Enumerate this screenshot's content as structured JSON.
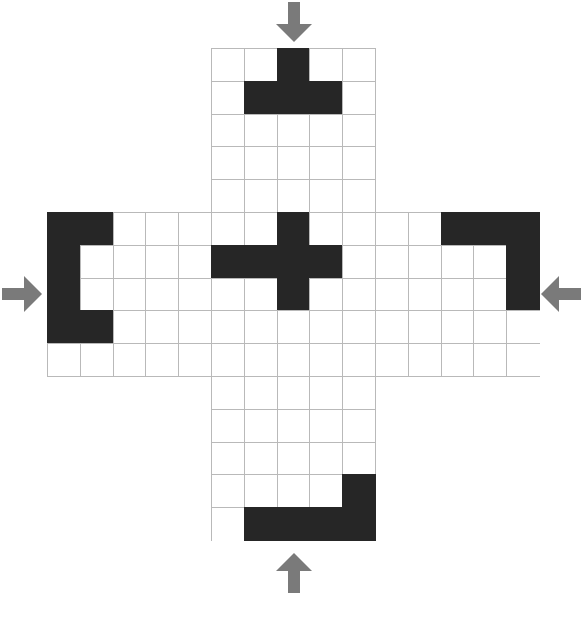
{
  "puzzle": {
    "title": "Plus-shaped grid folding puzzle",
    "grid": {
      "columns": 15,
      "rows": 15,
      "cell_size": 32.8,
      "origin_x": 47,
      "origin_y": 48,
      "line_color": "#b9b9b9",
      "cell_color": "#ffffff",
      "filled_color": "#262626",
      "shape": "plus-cross",
      "arm_span_start": 5,
      "arm_span_end": 9
    },
    "arrows": {
      "color": "#7a7a7a",
      "items": [
        {
          "name": "arrow-top",
          "direction": "down",
          "x": 272,
          "y": 2,
          "w": 44,
          "h": 40
        },
        {
          "name": "arrow-left",
          "direction": "right",
          "x": 2,
          "y": 272,
          "w": 40,
          "h": 44
        },
        {
          "name": "arrow-right",
          "direction": "left",
          "x": 541,
          "y": 272,
          "w": 40,
          "h": 44
        },
        {
          "name": "arrow-bottom",
          "direction": "up",
          "x": 272,
          "y": 553,
          "w": 44,
          "h": 40
        }
      ]
    },
    "filled_cells": {
      "top_arm": [
        [
          7,
          0
        ],
        [
          6,
          1
        ],
        [
          7,
          1
        ],
        [
          8,
          1
        ]
      ],
      "left_arm": [
        [
          0,
          5
        ],
        [
          1,
          5
        ],
        [
          0,
          6
        ],
        [
          0,
          7
        ],
        [
          0,
          8
        ],
        [
          1,
          8
        ]
      ],
      "center": [
        [
          7,
          5
        ],
        [
          5,
          6
        ],
        [
          6,
          6
        ],
        [
          7,
          6
        ],
        [
          8,
          6
        ],
        [
          7,
          7
        ]
      ],
      "right_arm": [
        [
          12,
          5
        ],
        [
          13,
          5
        ],
        [
          14,
          5
        ],
        [
          14,
          6
        ],
        [
          14,
          7
        ]
      ],
      "bottom_arm": [
        [
          9,
          13
        ],
        [
          6,
          14
        ],
        [
          7,
          14
        ],
        [
          8,
          14
        ],
        [
          9,
          14
        ]
      ]
    }
  }
}
